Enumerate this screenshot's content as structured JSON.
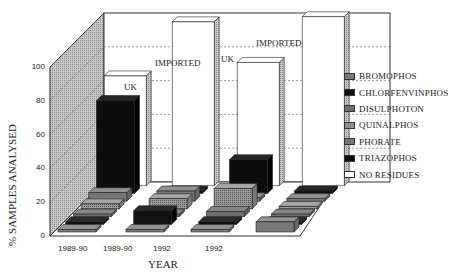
{
  "chart_data": {
    "type": "bar",
    "subtype": "3d-grouped-bar",
    "title": "",
    "xlabel": "YEAR",
    "ylabel": "% SAMPLES ANALYSED",
    "ylim": [
      0,
      100
    ],
    "yticks": [
      "0",
      "20",
      "40",
      "60",
      "80",
      "100"
    ],
    "grid": true,
    "legend_position": "right",
    "categories": [
      "1989-90",
      "1989-90",
      "1992",
      "1992"
    ],
    "group_labels": [
      "UK",
      "IMPORTED",
      "UK",
      "IMPORTED"
    ],
    "series": [
      {
        "name": "BROMOPHOS",
        "values": [
          1,
          1,
          1,
          6
        ],
        "color": "#7a7a7a"
      },
      {
        "name": "CHLORFENVINPHOS",
        "values": [
          1,
          8,
          1,
          1
        ],
        "color": "#111111"
      },
      {
        "name": "DISULPHOTON",
        "values": [
          1,
          1,
          3,
          1
        ],
        "color": "#6e6e6e"
      },
      {
        "name": "QUINALPHOS",
        "values": [
          3,
          6,
          12,
          1
        ],
        "color": "#8c8c8c"
      },
      {
        "name": "PHORATE",
        "values": [
          5,
          6,
          2,
          1
        ],
        "color": "#777777"
      },
      {
        "name": "TRIAZOPHOS",
        "values": [
          55,
          1,
          20,
          1
        ],
        "color": "#0d0d0d"
      },
      {
        "name": "NO RESIDUES",
        "values": [
          65,
          97,
          73,
          100
        ],
        "color": "#ffffff"
      }
    ]
  },
  "legend": {
    "items": [
      {
        "label": "BROMOPHOS",
        "color": "#7a7a7a"
      },
      {
        "label": "CHLORFENVINPHOS",
        "color": "#111111"
      },
      {
        "label": "DISULPHOTON",
        "color": "#6e6e6e"
      },
      {
        "label": "QUINALPHOS",
        "color": "#8c8c8c"
      },
      {
        "label": "PHORATE",
        "color": "#777777"
      },
      {
        "label": "TRIAZOPHOS",
        "color": "#0d0d0d"
      },
      {
        "label": "NO RESIDUES",
        "color": "#ffffff"
      }
    ]
  }
}
